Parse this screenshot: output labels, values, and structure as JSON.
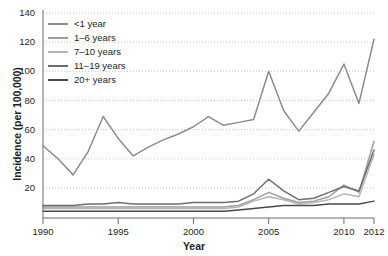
{
  "chart_data": {
    "type": "line",
    "title": "",
    "xlabel": "Year",
    "ylabel": "Incidence (per 100,000)",
    "xlim": [
      1990,
      2012
    ],
    "ylim": [
      0,
      145
    ],
    "yticks": [
      20,
      40,
      60,
      80,
      100,
      120,
      140
    ],
    "xticks": [
      1990,
      1995,
      2000,
      2005,
      2010,
      2012
    ],
    "grid": "horizontal-dotted",
    "legend_position": "top-left",
    "x": [
      1990,
      1991,
      1992,
      1993,
      1994,
      1995,
      1996,
      1997,
      1998,
      1999,
      2000,
      2001,
      2002,
      2003,
      2004,
      2005,
      2006,
      2007,
      2008,
      2009,
      2010,
      2011,
      2012
    ],
    "series": [
      {
        "name": "<1 year",
        "color": "#8c8c8c",
        "values": [
          49,
          40,
          29,
          45,
          69,
          54,
          42,
          48,
          53,
          57,
          62,
          69,
          63,
          65,
          67,
          100,
          73,
          59,
          72,
          85,
          105,
          78,
          122
        ]
      },
      {
        "name": "1–6 years",
        "color": "#9e9e9e",
        "values": [
          7,
          7,
          7,
          7,
          7,
          7,
          7,
          7,
          7,
          7,
          7,
          7,
          7,
          8,
          12,
          17,
          13,
          10,
          11,
          14,
          22,
          17,
          52
        ]
      },
      {
        "name": "7–10 years",
        "color": "#b5b5b5",
        "values": [
          6,
          6,
          6,
          6,
          6,
          6,
          6,
          6,
          6,
          6,
          6,
          6,
          6,
          7,
          11,
          14,
          12,
          9,
          10,
          12,
          16,
          14,
          43
        ]
      },
      {
        "name": "11–19 years",
        "color": "#6e6e6e",
        "values": [
          8,
          8,
          8,
          9,
          9,
          10,
          9,
          9,
          9,
          9,
          10,
          10,
          10,
          11,
          16,
          26,
          18,
          12,
          13,
          17,
          21,
          18,
          46
        ]
      },
      {
        "name": "20+ years",
        "color": "#4a4a4a",
        "values": [
          4,
          4,
          4,
          4,
          4,
          4,
          4,
          4,
          4,
          4,
          4,
          4,
          4,
          5,
          6,
          7,
          8,
          8,
          8,
          9,
          9,
          9,
          11
        ]
      }
    ]
  },
  "axis": {
    "xlabel": "Year",
    "ylabel": "Incidence (per 100,000)"
  }
}
